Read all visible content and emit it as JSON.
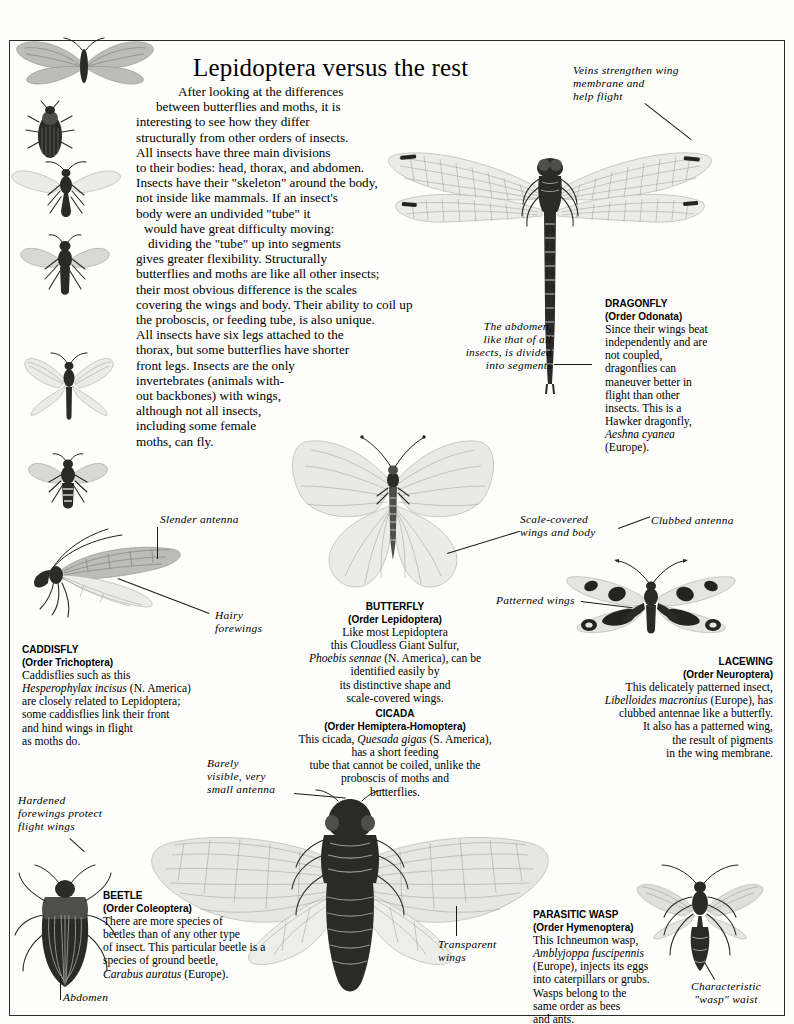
{
  "page": {
    "title": "Lepidoptera versus the rest",
    "intro": "After looking at the differences between butterflies and moths, it is interesting to see how they differ structurally from other orders of insects. All insects have three main divisions to their bodies: head, thorax, and abdomen. Insects have their \"skeleton\" around the body, not inside like mammals. If an insect's body were an undivided \"tube\" it would have great difficulty moving: dividing the \"tube\" up into segments gives greater flexibility. Structurally butterflies and moths are like all other insects; their most obvious difference is the scales covering the wings and body. Their ability to coil up the proboscis, or feeding tube, is also unique. All insects have six legs attached to the thorax, but some butterflies have shorter front legs. Insects are the only invertebrates (animals without backbones) with wings, although not all insects, including some female moths, can fly.",
    "intro_lines": [
      "After looking at the differences",
      "between butterflies and moths, it is",
      "interesting to see how they differ",
      "structurally from other orders of insects.",
      "All insects have three main divisions",
      "to their bodies: head, thorax, and abdomen.",
      "Insects have their \"skeleton\" around the body,",
      "not inside like mammals. If an insect's",
      "body were an undivided \"tube\" it",
      "would have great difficulty moving:",
      "dividing the \"tube\" up into segments",
      "gives greater flexibility. Structurally",
      "butterflies and moths are like all other insects;",
      "their most obvious difference is the scales",
      "covering the wings and body. Their ability to coil up",
      "the proboscis, or feeding tube, is also unique.",
      "All insects have six legs attached to the",
      "thorax, but some butterflies have shorter",
      "front legs. Insects are the only",
      "invertebrates (animals with-",
      "out backbones) with wings,",
      "although not all insects,",
      "including some female",
      "moths, can fly."
    ]
  },
  "captions": {
    "dragonfly": {
      "name": "DRAGONFLY",
      "order": "(Order Odonata)",
      "lines": [
        "Since their wings beat",
        "independently and are",
        "not coupled,",
        "dragonflies can",
        "maneuver better in",
        "flight than other",
        "insects. This is a",
        "Hawker dragonfly,"
      ],
      "species": "Aeshna cyanea",
      "tail": "(Europe)."
    },
    "caddisfly": {
      "name": "CADDISFLY",
      "order": "(Order Trichoptera)",
      "line1": "Caddisflies such as this",
      "species": "Hesperophylax incisus",
      "after_species": "(N. America)",
      "lines": [
        "are  closely related to Lepidoptera;",
        "some caddisflies link their front",
        "and hind wings in flight",
        "as moths do."
      ]
    },
    "butterfly": {
      "name": "BUTTERFLY",
      "order": "(Order Lepidoptera)",
      "line1": "Like most Lepidoptera",
      "line2": "this Cloudless Giant Sulfur,",
      "species": "Phoebis sennae",
      "after_species": "(N. America), can be",
      "lines": [
        "identified easily by",
        "its distinctive shape and",
        "scale-covered wings."
      ]
    },
    "cicada": {
      "name": "CICADA",
      "order": "(Order Hemiptera-Homoptera)",
      "line1_a": "This cicada, ",
      "species": "Quesada gigas",
      "line1_b": " (S. America),",
      "lines": [
        "has a short feeding",
        "tube that cannot be  coiled, unlike the",
        "proboscis of moths and",
        "butterflies."
      ]
    },
    "lacewing": {
      "name": "LACEWING",
      "order": "(Order Neuroptera)",
      "line1": "This delicately patterned insect,",
      "species": "Libelloides macronius",
      "after_species": "(Europe), has",
      "lines": [
        "clubbed antennae like a butterfly.",
        "It also has a patterned wing,",
        "the result of pigments",
        "in the wing membrane."
      ]
    },
    "beetle": {
      "name": "BEETLE",
      "order": "(Order Coleoptera)",
      "lines": [
        "There are more species of",
        "beetles than of any other type",
        "of  insect. This particular beetle is a",
        "species of ground beetle,"
      ],
      "species": "Carabus auratus",
      "after_species": "(Europe)."
    },
    "wasp": {
      "name": "PARASITIC  WASP",
      "order": "(Order Hymenoptera)",
      "line1": "This Ichneumon wasp,",
      "species": "Amblyjoppa  fuscipennis",
      "lines": [
        "(Europe), injects its eggs",
        "into caterpillars or grubs.",
        "Wasps belong to the",
        "same order as bees",
        "and ants."
      ]
    }
  },
  "annotations": {
    "veins": [
      "Veins strengthen wing",
      "membrane and",
      "help  flight"
    ],
    "abdomen_segments": [
      "The abdomen,",
      "like that of all",
      "insects, is divided",
      "into segments"
    ],
    "scale_covered": [
      "Scale-covered",
      "wings and body"
    ],
    "slender_antenna": "Slender  antenna",
    "hairy_forewings": [
      "Hairy",
      "forewings"
    ],
    "clubbed_antenna": "Clubbed  antenna",
    "patterned_wings": "Patterned  wings",
    "barely_visible": [
      "Barely",
      "visible,  very",
      "small  antenna"
    ],
    "hardened_forewings": [
      "Hardened",
      "forewings  protect",
      "flight  wings"
    ],
    "transparent_wings": [
      "Transparent",
      "wings"
    ],
    "abdomen": "Abdomen",
    "wasp_waist": [
      "Characteristic",
      "\"wasp\"  waist"
    ]
  }
}
